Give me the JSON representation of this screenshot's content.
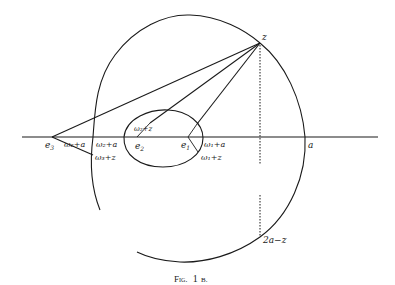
{
  "figure": {
    "caption": "Fig. 1 B.",
    "caption_prefix": "Fig.",
    "caption_number": "1",
    "caption_suffix": "B.",
    "labels": {
      "z": "z",
      "a": "a",
      "two_a_minus_z": "2a−z",
      "e1": "e",
      "e1_sub": "1",
      "e2": "e",
      "e2_sub": "2",
      "e3": "e",
      "e3_sub": "3",
      "omega1_plus_a": "ω₁+a",
      "omega1_plus_z": "ω₁+z",
      "omega2_plus_z": "ω₂+z",
      "omega2_plus_a_left": "ω₂+a",
      "omega2_plus_a_right": "ω₂+a",
      "omega3_plus_z": "ω₃+z"
    },
    "colors": {
      "ink": "#1a1a1a",
      "background": "#ffffff"
    }
  }
}
